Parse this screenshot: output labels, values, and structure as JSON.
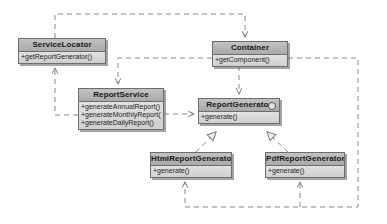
{
  "diagram": {
    "type": "class-diagram",
    "colors": {
      "header_top": "#c3c3c3",
      "header_bottom": "#a9a9a9",
      "body_top": "#e2e2e2",
      "body_bottom": "#cfcfcf",
      "border": "#6d6d6d",
      "line": "#8a8a8a",
      "background": "#ffffff"
    }
  },
  "classes": [
    {
      "id": "service-locator",
      "name": "ServiceLocator",
      "stereotype": "",
      "is_interface": false,
      "members": [
        "+getReportGenerator()"
      ],
      "x": 18,
      "y": 38,
      "w": 88,
      "h": 25
    },
    {
      "id": "container",
      "name": "Container",
      "stereotype": "",
      "is_interface": false,
      "members": [
        "+getComponent()"
      ],
      "x": 212,
      "y": 41,
      "w": 76,
      "h": 25
    },
    {
      "id": "report-service",
      "name": "ReportService",
      "stereotype": "",
      "is_interface": false,
      "members": [
        "+generateAnnualReport()",
        "+generateMonthlyReport()",
        "+generateDailyReport()"
      ],
      "x": 78,
      "y": 88,
      "w": 86,
      "h": 43
    },
    {
      "id": "report-generator",
      "name": "ReportGenerator",
      "stereotype": "interface",
      "is_interface": true,
      "members": [
        "+generate()"
      ],
      "x": 198,
      "y": 98,
      "w": 82,
      "h": 26
    },
    {
      "id": "html-report-generator",
      "name": "HtmlReportGenerator",
      "stereotype": "",
      "is_interface": false,
      "members": [
        "+generate()"
      ],
      "x": 150,
      "y": 152,
      "w": 82,
      "h": 26
    },
    {
      "id": "pdf-report-generator",
      "name": "PdfReportGenerator",
      "stereotype": "",
      "is_interface": false,
      "members": [
        "+generate()"
      ],
      "x": 265,
      "y": 152,
      "w": 80,
      "h": 26
    }
  ],
  "relationships": [
    {
      "id": "rel-servicelocator-container",
      "from": "service-locator",
      "to": "container",
      "kind": "dependency",
      "style": "dashed",
      "arrow": "open"
    },
    {
      "id": "rel-container-reportservice",
      "from": "container",
      "to": "report-service",
      "kind": "dependency",
      "style": "dashed",
      "arrow": "open"
    },
    {
      "id": "rel-reportservice-servicelocator",
      "from": "report-service",
      "to": "service-locator",
      "kind": "dependency",
      "style": "dashed",
      "arrow": "open"
    },
    {
      "id": "rel-reportservice-reportgenerator",
      "from": "report-service",
      "to": "report-generator",
      "kind": "dependency",
      "style": "dashed",
      "arrow": "open"
    },
    {
      "id": "rel-container-reportgenerator",
      "from": "container",
      "to": "report-generator",
      "kind": "dependency",
      "style": "dashed",
      "arrow": "open"
    },
    {
      "id": "rel-html-realizes-reportgenerator",
      "from": "html-report-generator",
      "to": "report-generator",
      "kind": "realization",
      "style": "dashed",
      "arrow": "hollow-triangle"
    },
    {
      "id": "rel-pdf-realizes-reportgenerator",
      "from": "pdf-report-generator",
      "to": "report-generator",
      "kind": "realization",
      "style": "dashed",
      "arrow": "hollow-triangle"
    },
    {
      "id": "rel-container-html",
      "from": "container",
      "to": "html-report-generator",
      "kind": "dependency",
      "style": "dashed",
      "arrow": "open"
    },
    {
      "id": "rel-container-pdf",
      "from": "container",
      "to": "pdf-report-generator",
      "kind": "dependency",
      "style": "dashed",
      "arrow": "open"
    }
  ]
}
